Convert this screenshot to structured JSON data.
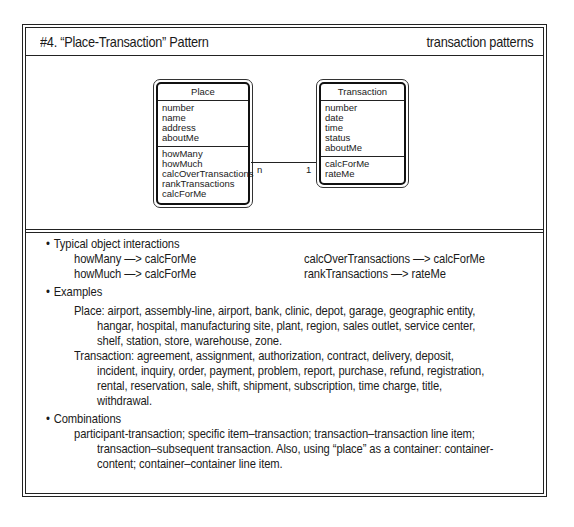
{
  "header": {
    "title": "#4. “Place-Transaction” Pattern",
    "category": "transaction patterns"
  },
  "diagram": {
    "classes": [
      {
        "name": "Place",
        "attributes": [
          "number",
          "name",
          "address",
          "aboutMe"
        ],
        "methods": [
          "howMany",
          "howMuch",
          "calcOverTransactions",
          "rankTransactions",
          "calcForMe"
        ]
      },
      {
        "name": "Transaction",
        "attributes": [
          "number",
          "date",
          "time",
          "status",
          "aboutMe"
        ],
        "methods": [
          "calcForMe",
          "rateMe"
        ]
      }
    ],
    "association": {
      "from": "Place",
      "to": "Transaction",
      "from_multiplicity": "n",
      "to_multiplicity": "1"
    }
  },
  "notes": {
    "interactions": {
      "heading": "Typical object interactions",
      "items": [
        "howMany —> calcForMe",
        "howMuch —> calcForMe",
        "calcOverTransactions —> calcForMe",
        "rankTransactions —> rateMe"
      ]
    },
    "examples": {
      "heading": "Examples",
      "place_lines": [
        "Place: airport, assembly-line, airport, bank, clinic, depot, garage, geographic entity,",
        "hangar, hospital, manufacturing site, plant, region, sales outlet, service center,",
        "shelf, station, store, warehouse, zone."
      ],
      "transaction_lines": [
        "Transaction: agreement, assignment, authorization, contract, delivery, deposit,",
        "incident, inquiry, order, payment, problem, report, purchase, refund, registration,",
        "rental, reservation, sale, shift, shipment, subscription, time charge, title,",
        "withdrawal."
      ]
    },
    "combinations": {
      "heading": "Combinations",
      "lines": [
        "participant-transaction; specific item–transaction; transaction–transaction line item;",
        "transaction–subsequent transaction. Also, using “place” as a container: container-",
        "content; container–container line item."
      ]
    }
  }
}
